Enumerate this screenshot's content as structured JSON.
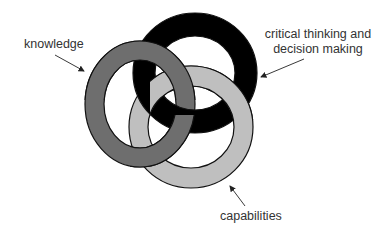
{
  "diagram": {
    "type": "interlocking-rings",
    "rings": [
      {
        "id": "knowledge",
        "label": "knowledge",
        "color": "#6e6e6e"
      },
      {
        "id": "critical",
        "label": "critical thinking and decision making",
        "label_line1": "critical thinking and",
        "label_line2": "decision making",
        "color": "#000000"
      },
      {
        "id": "capabilities",
        "label": "capabilities",
        "color": "#bfbfbf"
      }
    ],
    "outline_color": "#111111",
    "background": "#ffffff"
  },
  "labels": {
    "knowledge": "knowledge",
    "critical_line1": "critical thinking and",
    "critical_line2": "decision making",
    "capabilities": "capabilities"
  }
}
